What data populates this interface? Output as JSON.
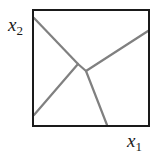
{
  "diagram": {
    "type": "partition-of-square",
    "axes": {
      "x_label": "x",
      "x_subscript": "1",
      "y_label": "x",
      "y_subscript": "2"
    },
    "box": {
      "x": 33,
      "y": 10,
      "width": 116,
      "height": 116
    },
    "colors": {
      "box": "#1a1a1a",
      "lines": "#808080",
      "text": "#1a1a1a"
    },
    "nodes": [
      {
        "id": "j1",
        "x": 78,
        "y": 64
      },
      {
        "id": "j2",
        "x": 86,
        "y": 71
      }
    ],
    "segments": [
      {
        "from": [
          34,
          18
        ],
        "to": [
          78,
          64
        ]
      },
      {
        "from": [
          78,
          64
        ],
        "to": [
          86,
          71
        ]
      },
      {
        "from": [
          86,
          71
        ],
        "to": [
          148,
          31
        ]
      },
      {
        "from": [
          78,
          64
        ],
        "to": [
          34,
          115
        ]
      },
      {
        "from": [
          86,
          71
        ],
        "to": [
          107,
          125
        ]
      }
    ]
  }
}
